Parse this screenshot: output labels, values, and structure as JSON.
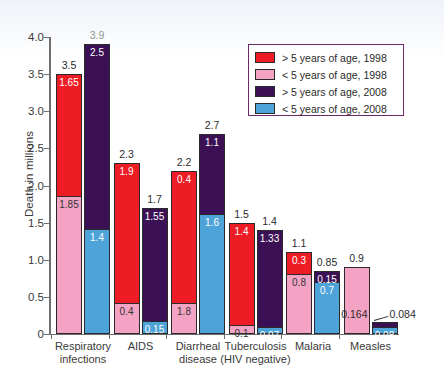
{
  "chart_data": {
    "type": "bar",
    "title": "",
    "xlabel": "",
    "ylabel": "Death in millions",
    "ylim": [
      0,
      4.0
    ],
    "ytick_labels": [
      "4.0",
      "3.5",
      "3.0",
      "2.5",
      "2.0",
      "1.5",
      "1.0",
      "0.5",
      "0"
    ],
    "ytick_values": [
      4.0,
      3.5,
      3.0,
      2.5,
      2.0,
      1.5,
      1.0,
      0.5,
      0
    ],
    "grid": false,
    "legend_position": "top-right",
    "categories": [
      "Respiratory\ninfections",
      "AIDS",
      "Diarrheal\ndisease",
      "Tuberculosis\n(HIV negative)",
      "Malaria",
      "Measles"
    ],
    "series": [
      {
        "name": "> 5 years of age, 1998",
        "color": "#ee1c25",
        "values": [
          1.65,
          1.9,
          1.8,
          1.4,
          0.3,
          0
        ]
      },
      {
        "name": "< 5 years of age, 1998",
        "color": "#f4a3c4",
        "values": [
          1.85,
          0.4,
          0.4,
          0.1,
          0.8,
          0.9
        ]
      },
      {
        "name": "> 5 years of age, 2008",
        "color": "#3b1055",
        "values": [
          2.5,
          1.55,
          1.1,
          1.33,
          0.15,
          0.084
        ]
      },
      {
        "name": "< 5 years of age, 2008",
        "color": "#4ea3d8",
        "values": [
          1.4,
          0.15,
          1.6,
          0.07,
          0.7,
          0.08
        ]
      }
    ],
    "totals_1998": [
      3.5,
      2.3,
      2.2,
      1.5,
      1.1,
      0.9
    ],
    "totals_2008": [
      3.9,
      1.7,
      2.7,
      1.4,
      0.85,
      0.164
    ],
    "bar_totals_labels": {
      "b1998": [
        "3.5",
        "2.3",
        "2.2",
        "1.5",
        "1.1",
        "0.9"
      ],
      "b2008": [
        "3.9",
        "1.7",
        "2.7",
        "1.4",
        "0.85",
        "0.164"
      ]
    },
    "segment_labels": {
      "gt5_1998": [
        "1.65",
        "1.9",
        "1.8",
        "1.4",
        "0.3",
        ""
      ],
      "lt5_1998": [
        "1.85",
        "0.4",
        "1.8",
        "0.1",
        "0.8",
        ""
      ],
      "gt5_2008": [
        "2.5",
        "1.55",
        "1.1",
        "1.33",
        "0.15",
        ""
      ],
      "lt5_2008": [
        "1.4",
        "0.15",
        "1.6",
        "0.07",
        "0.7",
        "0.08"
      ]
    },
    "annotations": [
      {
        "text": "0.084",
        "target": "measles-2008-upper-segment"
      }
    ]
  },
  "legend": {
    "items": [
      {
        "label": "> 5 years of age, 1998",
        "color": "#ee1c25"
      },
      {
        "label": "< 5 years of age, 1998",
        "color": "#f4a3c4"
      },
      {
        "label": "> 5 years of age, 2008",
        "color": "#3b1055"
      },
      {
        "label": "< 5 years of age, 2008",
        "color": "#4ea3d8"
      }
    ],
    "border_color": "#6b2b6b"
  },
  "source": {
    "text": "World Health Organization, 2012 www.who.int/infectious-disease-report/pages/graph5.html"
  }
}
